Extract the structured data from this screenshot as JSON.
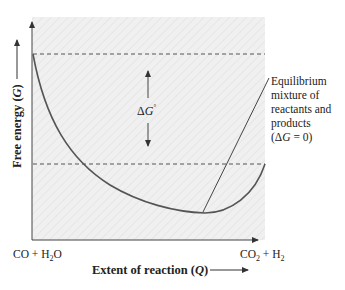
{
  "diagram": {
    "type": "free-energy-vs-extent-of-reaction",
    "y_axis_label": {
      "prefix": "Free energy (",
      "var": "G",
      "suffix": ")"
    },
    "x_axis_label": {
      "prefix": "Extent of reaction (",
      "var": "Q",
      "suffix": ")"
    },
    "reactants": {
      "a": "CO + H",
      "sub": "2",
      "b": "O"
    },
    "products": {
      "a": "CO",
      "sub": "2",
      "b": " + H",
      "sub2": "2"
    },
    "delta_g_label": {
      "delta": "Δ",
      "var": "G",
      "sup": "°"
    },
    "equilibrium_annotation": {
      "lines": [
        "Equilibrium",
        "mixture of",
        "reactants and",
        "products"
      ],
      "condition": {
        "open": "(Δ",
        "var": "G",
        "rest": " = 0)"
      }
    },
    "colors": {
      "plot_background": "#efefef",
      "curve": "#555555",
      "dashed": "#555555",
      "axis": "#444444",
      "text": "#222222"
    }
  }
}
